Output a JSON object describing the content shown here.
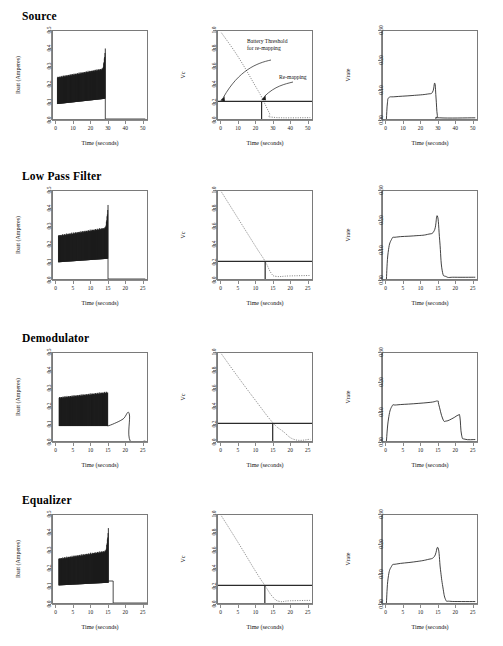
{
  "figure": {
    "title_rows": [
      "Source",
      "Low Pass Filter",
      "Demodulator",
      "Equalizer"
    ],
    "axis_labels": {
      "x": "Time (seconds)",
      "y_current": "Ibatt (Amperes)",
      "y_vc": "Vc",
      "y_vrate": "Vrate"
    },
    "annotations": {
      "battery_threshold_line1": "Battery Threshold",
      "battery_threshold_line2": "for re-mapping",
      "remapping": "Re-mapping"
    },
    "colors": {
      "frame": "#7a7a7a",
      "trace": "#1a1a1a",
      "dotted": "#6e6e6e",
      "threshold": "#2b2b2b",
      "text": "#111111"
    }
  },
  "chart_data": [
    {
      "id": "source-ibatt",
      "row": "Source",
      "column": "left",
      "type": "area",
      "title": "",
      "xlabel": "Time (seconds)",
      "ylabel": "Ibatt (Amperes)",
      "xlim": [
        -2,
        53
      ],
      "ylim": [
        0.0,
        0.5
      ],
      "xticks": [
        0,
        10,
        20,
        30,
        40,
        50
      ],
      "yticks": [
        0.0,
        0.1,
        0.2,
        0.3,
        0.4,
        0.5
      ],
      "ytick_labels": [
        "0.0",
        "0.1",
        "0.2",
        "0.3",
        "0.4",
        "0.5"
      ],
      "grid": false,
      "description": "Dense oscillating current band from t=0.5 to t=28.5, lower envelope rising 0.085 to 0.115, upper envelope rising 0.235 to 0.40 with sharp spike at end; drops to 0 after t=29",
      "band": {
        "t_start": 0.6,
        "t_end": 28.6,
        "lower_start": 0.085,
        "lower_end": 0.115,
        "upper_start": 0.235,
        "upper_end": 0.285,
        "spike_peak": 0.4,
        "tail_value": 0.0,
        "tail_end": 52
      }
    },
    {
      "id": "source-vc",
      "row": "Source",
      "column": "middle",
      "type": "line",
      "xlabel": "Time (seconds)",
      "ylabel": "Vc",
      "xlim": [
        -2,
        53
      ],
      "ylim": [
        0.0,
        1.0
      ],
      "xticks": [
        0,
        10,
        20,
        30,
        40,
        50
      ],
      "yticks": [
        0.0,
        0.2,
        0.4,
        0.6,
        0.8,
        1.0
      ],
      "ytick_labels": [
        "0.0",
        "0.2",
        "0.4",
        "0.6",
        "0.8",
        "1.0"
      ],
      "grid": false,
      "threshold": 0.2,
      "remap_time": 23.5,
      "series": [
        {
          "name": "Vc discharge",
          "style": "dotted",
          "points": [
            [
              0,
              0.98
            ],
            [
              10,
              0.7
            ],
            [
              20,
              0.37
            ],
            [
              23.5,
              0.25
            ],
            [
              28,
              0.07
            ],
            [
              30,
              0.02
            ],
            [
              52,
              0.015
            ]
          ]
        }
      ]
    },
    {
      "id": "source-vrate",
      "row": "Source",
      "column": "right",
      "type": "line",
      "xlabel": "Time (seconds)",
      "ylabel": "Vrate",
      "xlim": [
        -2,
        53
      ],
      "ylim": [
        0.0,
        0.3
      ],
      "xticks": [
        0,
        10,
        20,
        30,
        40,
        50
      ],
      "yticks": [
        0.0,
        0.1,
        0.2,
        0.3
      ],
      "ytick_labels": [
        "0.00",
        "0.10",
        "0.20",
        "0.30"
      ],
      "grid": false,
      "series": [
        {
          "name": "Vrate",
          "style": "solid",
          "points": [
            [
              0,
              0.0
            ],
            [
              0.6,
              0.055
            ],
            [
              1.5,
              0.073
            ],
            [
              5,
              0.076
            ],
            [
              15,
              0.08
            ],
            [
              24,
              0.085
            ],
            [
              27,
              0.092
            ],
            [
              28.3,
              0.122
            ],
            [
              29,
              0.075
            ],
            [
              29.8,
              0.012
            ],
            [
              31,
              0.004
            ],
            [
              52,
              0.004
            ]
          ]
        }
      ]
    },
    {
      "id": "lowpass-ibatt",
      "row": "Low Pass Filter",
      "column": "left",
      "type": "area",
      "xlabel": "Time (seconds)",
      "ylabel": "Ibatt (Amperes)",
      "xlim": [
        -1,
        26.5
      ],
      "ylim": [
        0.0,
        0.5
      ],
      "xticks": [
        0,
        5,
        10,
        15,
        20,
        25
      ],
      "yticks": [
        0.0,
        0.1,
        0.2,
        0.3,
        0.4,
        0.5
      ],
      "ytick_labels": [
        "0.0",
        "0.1",
        "0.2",
        "0.3",
        "0.4",
        "0.5"
      ],
      "grid": false,
      "band": {
        "t_start": 0.6,
        "t_end": 15.1,
        "lower_start": 0.095,
        "lower_end": 0.115,
        "upper_start": 0.245,
        "upper_end": 0.29,
        "spike_peak": 0.42,
        "tail_value": 0.0,
        "tail_end": 26
      }
    },
    {
      "id": "lowpass-vc",
      "row": "Low Pass Filter",
      "column": "middle",
      "type": "line",
      "xlabel": "Time (seconds)",
      "ylabel": "Vc",
      "xlim": [
        -1,
        26.5
      ],
      "ylim": [
        0.0,
        1.0
      ],
      "xticks": [
        0,
        5,
        10,
        15,
        20,
        25
      ],
      "yticks": [
        0.0,
        0.2,
        0.4,
        0.6,
        0.8,
        1.0
      ],
      "ytick_labels": [
        "0.0",
        "0.2",
        "0.4",
        "0.6",
        "0.8",
        "1.0"
      ],
      "grid": false,
      "threshold": 0.2,
      "remap_time": 12.8,
      "series": [
        {
          "name": "Vc discharge",
          "style": "dotted",
          "points": [
            [
              0,
              0.99
            ],
            [
              5,
              0.68
            ],
            [
              10,
              0.37
            ],
            [
              12.8,
              0.2
            ],
            [
              14.5,
              0.07
            ],
            [
              16,
              0.03
            ],
            [
              20,
              0.035
            ],
            [
              26,
              0.04
            ]
          ]
        }
      ]
    },
    {
      "id": "lowpass-vrate",
      "row": "Low Pass Filter",
      "column": "right",
      "type": "line",
      "xlabel": "Time (seconds)",
      "ylabel": "Vrate",
      "xlim": [
        -1,
        26.5
      ],
      "ylim": [
        0.0,
        0.3
      ],
      "xticks": [
        0,
        5,
        10,
        15,
        20,
        25
      ],
      "yticks": [
        0.0,
        0.1,
        0.2,
        0.3
      ],
      "ytick_labels": [
        "0.00",
        "0.10",
        "0.20",
        "0.30"
      ],
      "grid": false,
      "series": [
        {
          "name": "Vrate",
          "style": "solid",
          "points": [
            [
              0,
              0.0
            ],
            [
              0.5,
              0.09
            ],
            [
              1.5,
              0.135
            ],
            [
              3,
              0.143
            ],
            [
              8,
              0.147
            ],
            [
              12,
              0.152
            ],
            [
              14,
              0.165
            ],
            [
              14.9,
              0.215
            ],
            [
              15.6,
              0.13
            ],
            [
              16.3,
              0.03
            ],
            [
              17.5,
              0.008
            ],
            [
              20,
              0.006
            ],
            [
              26,
              0.006
            ]
          ]
        }
      ]
    },
    {
      "id": "demod-ibatt",
      "row": "Demodulator",
      "column": "left",
      "type": "area",
      "xlabel": "Time (seconds)",
      "ylabel": "Ibatt (Amperes)",
      "xlim": [
        -1,
        26.5
      ],
      "ylim": [
        0.0,
        0.5
      ],
      "xticks": [
        0,
        5,
        10,
        15,
        20,
        25
      ],
      "yticks": [
        0.0,
        0.1,
        0.2,
        0.3,
        0.4,
        0.5
      ],
      "ytick_labels": [
        "0.0",
        "0.1",
        "0.2",
        "0.3",
        "0.4",
        "0.5"
      ],
      "grid": false,
      "band": {
        "t_start": 0.8,
        "t_end": 15.0,
        "lower_start": 0.085,
        "lower_end": 0.085,
        "upper_start": 0.245,
        "upper_end": 0.275,
        "spike_peak": 0.275,
        "tail_value": 0.0,
        "tail_end": 26
      },
      "tail_curve": [
        [
          15.0,
          0.085
        ],
        [
          17,
          0.1
        ],
        [
          19.5,
          0.125
        ],
        [
          21.3,
          0.155
        ],
        [
          21.6,
          0.0
        ],
        [
          26,
          0.0
        ]
      ]
    },
    {
      "id": "demod-vc",
      "row": "Demodulator",
      "column": "middle",
      "type": "line",
      "xlabel": "Time (seconds)",
      "ylabel": "Vc",
      "xlim": [
        -1,
        26.5
      ],
      "ylim": [
        0.0,
        1.0
      ],
      "xticks": [
        0,
        5,
        10,
        15,
        20,
        25
      ],
      "yticks": [
        0.0,
        0.2,
        0.4,
        0.6,
        0.8,
        1.0
      ],
      "ytick_labels": [
        "0.0",
        "0.2",
        "0.4",
        "0.6",
        "0.8",
        "1.0"
      ],
      "grid": false,
      "threshold": 0.2,
      "remap_time": 15.0,
      "series": [
        {
          "name": "Vc discharge",
          "style": "dotted",
          "points": [
            [
              0,
              0.99
            ],
            [
              5,
              0.72
            ],
            [
              10,
              0.46
            ],
            [
              15,
              0.21
            ],
            [
              18,
              0.11
            ],
            [
              21.5,
              0.015
            ],
            [
              26,
              0.02
            ]
          ]
        }
      ]
    },
    {
      "id": "demod-vrate",
      "row": "Demodulator",
      "column": "right",
      "type": "line",
      "xlabel": "Time (seconds)",
      "ylabel": "Vrate",
      "xlim": [
        -1,
        26.5
      ],
      "ylim": [
        0.0,
        0.3
      ],
      "xticks": [
        0,
        5,
        10,
        15,
        20,
        25
      ],
      "yticks": [
        0.0,
        0.1,
        0.2,
        0.3
      ],
      "ytick_labels": [
        "0.00",
        "0.10",
        "0.20",
        "0.30"
      ],
      "grid": false,
      "series": [
        {
          "name": "Vrate",
          "style": "solid",
          "points": [
            [
              0,
              0.0
            ],
            [
              0.6,
              0.075
            ],
            [
              1.6,
              0.118
            ],
            [
              3,
              0.123
            ],
            [
              8,
              0.127
            ],
            [
              13,
              0.132
            ],
            [
              15,
              0.136
            ],
            [
              15.3,
              0.125
            ],
            [
              16.5,
              0.075
            ],
            [
              17.5,
              0.068
            ],
            [
              19.5,
              0.078
            ],
            [
              21,
              0.088
            ],
            [
              21.5,
              0.082
            ],
            [
              22,
              0.02
            ],
            [
              23,
              0.006
            ],
            [
              26,
              0.005
            ]
          ]
        }
      ]
    },
    {
      "id": "equalizer-ibatt",
      "row": "Equalizer",
      "column": "left",
      "type": "area",
      "xlabel": "Time (seconds)",
      "ylabel": "Ibatt (Amperes)",
      "xlim": [
        -1,
        26.5
      ],
      "ylim": [
        0.0,
        0.5
      ],
      "xticks": [
        0,
        5,
        10,
        15,
        20,
        25
      ],
      "yticks": [
        0.0,
        0.1,
        0.2,
        0.3,
        0.4,
        0.5
      ],
      "ytick_labels": [
        "0.0",
        "0.1",
        "0.2",
        "0.3",
        "0.4",
        "0.5"
      ],
      "grid": false,
      "band": {
        "t_start": 0.7,
        "t_end": 15.2,
        "lower_start": 0.1,
        "lower_end": 0.115,
        "upper_start": 0.25,
        "upper_end": 0.295,
        "spike_peak": 0.425,
        "tail_value": 0.125,
        "tail_end": 16.5
      },
      "step_after": {
        "level": 0.125,
        "t_from": 15.2,
        "t_to": 16.6,
        "then": 0.0
      }
    },
    {
      "id": "equalizer-vc",
      "row": "Equalizer",
      "column": "middle",
      "type": "line",
      "xlabel": "Time (seconds)",
      "ylabel": "Vc",
      "xlim": [
        -1,
        26.5
      ],
      "ylim": [
        0.0,
        1.0
      ],
      "xticks": [
        0,
        5,
        10,
        15,
        20,
        25
      ],
      "yticks": [
        0.0,
        0.2,
        0.4,
        0.6,
        0.8,
        1.0
      ],
      "ytick_labels": [
        "0.0",
        "0.2",
        "0.4",
        "0.6",
        "0.8",
        "1.0"
      ],
      "grid": false,
      "threshold": 0.2,
      "remap_time": 12.7,
      "series": [
        {
          "name": "Vc discharge",
          "style": "dotted",
          "points": [
            [
              0,
              0.99
            ],
            [
              5,
              0.68
            ],
            [
              10,
              0.36
            ],
            [
              12.7,
              0.2
            ],
            [
              15,
              0.07
            ],
            [
              17,
              0.018
            ],
            [
              20,
              0.025
            ],
            [
              26,
              0.03
            ]
          ]
        }
      ]
    },
    {
      "id": "equalizer-vrate",
      "row": "Equalizer",
      "column": "right",
      "type": "line",
      "xlabel": "Time (seconds)",
      "ylabel": "Vrate",
      "xlim": [
        -1,
        26.5
      ],
      "ylim": [
        0.0,
        0.3
      ],
      "xticks": [
        0,
        5,
        10,
        15,
        20,
        25
      ],
      "yticks": [
        0.0,
        0.1,
        0.2,
        0.3
      ],
      "ytick_labels": [
        "0.00",
        "0.10",
        "0.20",
        "0.30"
      ],
      "grid": false,
      "series": [
        {
          "name": "Vrate",
          "style": "solid",
          "points": [
            [
              0,
              0.0
            ],
            [
              0.5,
              0.085
            ],
            [
              1.5,
              0.125
            ],
            [
              3,
              0.133
            ],
            [
              8,
              0.14
            ],
            [
              12,
              0.148
            ],
            [
              14,
              0.158
            ],
            [
              15.1,
              0.188
            ],
            [
              15.8,
              0.115
            ],
            [
              16.5,
              0.055
            ],
            [
              17.3,
              0.012
            ],
            [
              18.5,
              0.006
            ],
            [
              22,
              0.005
            ],
            [
              26,
              0.005
            ]
          ]
        }
      ]
    }
  ]
}
